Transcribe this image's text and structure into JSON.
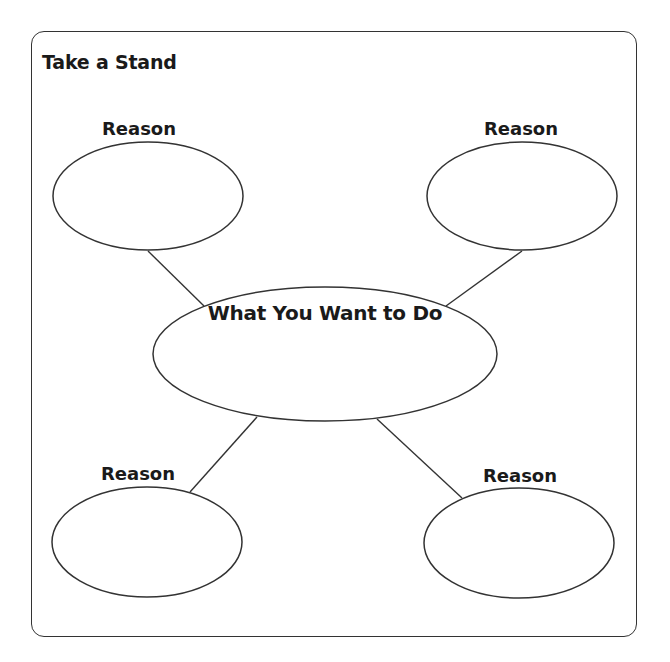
{
  "worksheet": {
    "title": "Take a Stand",
    "center": {
      "label": "What You Want to Do"
    },
    "reasons": [
      {
        "position": "top-left",
        "label": "Reason"
      },
      {
        "position": "top-right",
        "label": "Reason"
      },
      {
        "position": "bottom-left",
        "label": "Reason"
      },
      {
        "position": "bottom-right",
        "label": "Reason"
      }
    ]
  },
  "colors": {
    "background": "#ffffff",
    "stroke": "#333333",
    "text": "#1a1a1a"
  }
}
